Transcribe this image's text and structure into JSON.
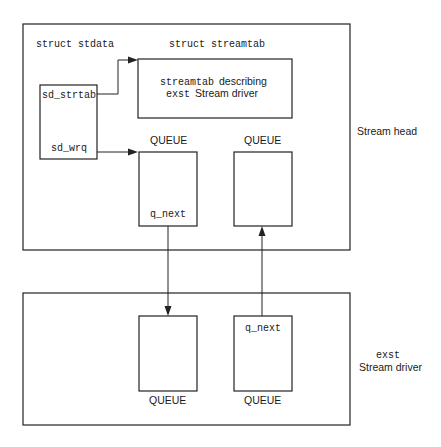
{
  "diagram": {
    "stream_head": {
      "label": "Stream head",
      "stdata": {
        "title": "struct stdata",
        "fields": [
          "sd_strtab",
          "sd_wrq"
        ]
      },
      "streamtab": {
        "title": "struct streamtab",
        "desc_line1_mono": "streamtab",
        "desc_line1_sans": "describing",
        "desc_line2_mono": "exst",
        "desc_line2_sans": "Stream driver"
      },
      "queues": [
        {
          "label": "QUEUE",
          "field": "q_next"
        },
        {
          "label": "QUEUE",
          "field": ""
        }
      ]
    },
    "driver": {
      "label_line1": "exst",
      "label_line2": "Stream driver",
      "queues": [
        {
          "label": "QUEUE",
          "field": ""
        },
        {
          "label": "QUEUE",
          "field": "q_next"
        }
      ]
    },
    "colors": {
      "stroke": "#222222",
      "background": "#ffffff",
      "text": "#1a1a1a"
    }
  }
}
